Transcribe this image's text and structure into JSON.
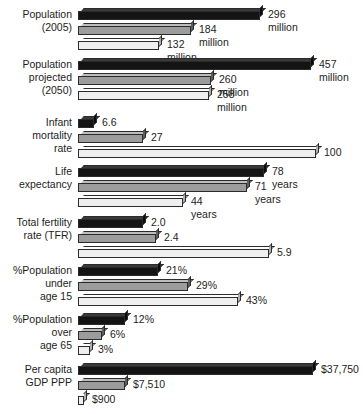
{
  "chart_data": {
    "type": "bar",
    "orientation": "horizontal",
    "title": "",
    "xlabel": "",
    "ylabel": "",
    "grid": false,
    "legend": "none",
    "note": "Grouped 3D horizontal bar chart; each metric group is scaled independently to its own maximum.",
    "series": [
      {
        "name": "series-1",
        "shade": "dark",
        "color": "#141414"
      },
      {
        "name": "series-2",
        "shade": "medium-gray",
        "color": "#9c9c9c"
      },
      {
        "name": "series-3",
        "shade": "light",
        "color": "#efefef"
      }
    ],
    "categories": [
      "Population (2005)",
      "Population projected (2050)",
      "Infant mortality rate",
      "Life expectancy",
      "Total fertility rate (TFR)",
      "%Population under age 15",
      "%Population over age 65",
      "Per capita GDP PPP"
    ],
    "groups": [
      {
        "label": "Population\n(2005)",
        "bars": [
          {
            "value": 296,
            "value_label": "296 million",
            "length_px": 182
          },
          {
            "value": 184,
            "value_label": "184 million",
            "length_px": 113
          },
          {
            "value": 132,
            "value_label": "132 million",
            "length_px": 81
          }
        ]
      },
      {
        "label": "Population\nprojected\n(2050)",
        "bars": [
          {
            "value": 457,
            "value_label": "457\nmillion",
            "length_px": 233
          },
          {
            "value": 260,
            "value_label": "260 million",
            "length_px": 133
          },
          {
            "value": 258,
            "value_label": "258 million",
            "length_px": 131
          }
        ]
      },
      {
        "label": "Infant\nmortality\nrate",
        "bars": [
          {
            "value": 6.6,
            "value_label": "6.6",
            "length_px": 16
          },
          {
            "value": 27,
            "value_label": "27",
            "length_px": 65
          },
          {
            "value": 100,
            "value_label": "100",
            "length_px": 238
          }
        ]
      },
      {
        "label": "Life\nexpectancy",
        "bars": [
          {
            "value": 78,
            "value_label": "78 years",
            "length_px": 186
          },
          {
            "value": 71,
            "value_label": "71 years",
            "length_px": 169
          },
          {
            "value": 44,
            "value_label": "44 years",
            "length_px": 105
          }
        ]
      },
      {
        "label": "Total fertility\nrate (TFR)",
        "bars": [
          {
            "value": 2.0,
            "value_label": "2.0",
            "length_px": 65
          },
          {
            "value": 2.4,
            "value_label": "2.4",
            "length_px": 78
          },
          {
            "value": 5.9,
            "value_label": "5.9",
            "length_px": 191
          }
        ]
      },
      {
        "label": "%Population\nunder\nage 15",
        "bars": [
          {
            "value": 21,
            "value_label": "21%",
            "length_px": 80
          },
          {
            "value": 29,
            "value_label": "29%",
            "length_px": 110
          },
          {
            "value": 43,
            "value_label": "43%",
            "length_px": 160
          }
        ]
      },
      {
        "label": "%Population\nover\nage 65",
        "bars": [
          {
            "value": 12,
            "value_label": "12%",
            "length_px": 47
          },
          {
            "value": 6,
            "value_label": "6%",
            "length_px": 24
          },
          {
            "value": 3,
            "value_label": "3%",
            "length_px": 12
          }
        ]
      },
      {
        "label": "Per capita\nGDP PPP",
        "bars": [
          {
            "value": 37750,
            "value_label": "$37,750",
            "length_px": 235
          },
          {
            "value": 7510,
            "value_label": "$7,510",
            "length_px": 47
          },
          {
            "value": 900,
            "value_label": "$900",
            "length_px": 6
          }
        ]
      }
    ]
  }
}
